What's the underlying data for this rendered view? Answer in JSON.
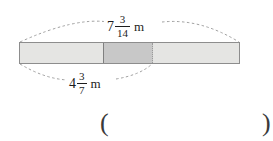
{
  "figure": {
    "type": "fraction-bar-diagram",
    "bar": {
      "segments": [
        {
          "name": "left-light-segment",
          "shade": "#e5e5e3"
        },
        {
          "name": "middle-dark-segment",
          "shade": "#c8c8c8"
        },
        {
          "name": "right-light-segment",
          "shade": "#e5e5e3"
        }
      ],
      "dividers": [
        {
          "name": "solid-divider",
          "style": "solid"
        },
        {
          "name": "dotted-divider",
          "style": "dotted"
        }
      ]
    },
    "labels": {
      "top": {
        "whole": "7",
        "numerator": "3",
        "denominator": "14",
        "unit": "m",
        "text": "7 3/14 m",
        "spans": "full-bar"
      },
      "bottom": {
        "whole": "4",
        "numerator": "3",
        "denominator": "7",
        "unit": "m",
        "text": "4 3/7 m",
        "spans": "left-edge-to-dotted-divider"
      }
    }
  },
  "answer": {
    "open_paren": "(",
    "close_paren": ")",
    "value": ""
  },
  "colors": {
    "bar_outline": "#8d8d8d",
    "light_segment": "#e5e5e3",
    "dark_segment": "#c8c8c8",
    "dashed_arc": "#9a9a9a",
    "text": "#1c1c1c"
  }
}
